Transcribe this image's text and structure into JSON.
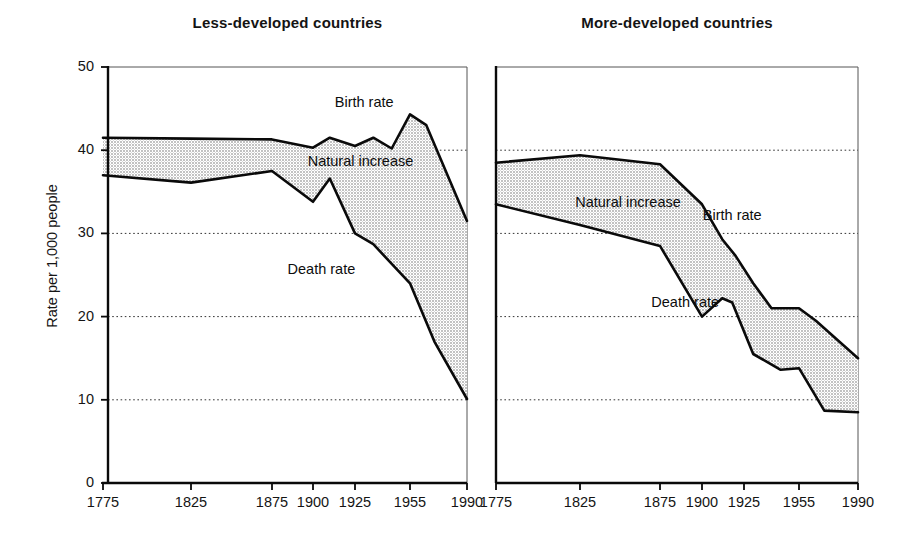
{
  "figure": {
    "ylabel": "Rate per 1,000 people",
    "series_labels": {
      "birth": "Birth rate",
      "death": "Death rate",
      "gap": "Natural increase"
    }
  },
  "chart_data": [
    {
      "type": "area",
      "title": "Less-developed countries",
      "xlabel": "",
      "ylabel": "Rate per 1,000 people",
      "ylim": [
        0,
        50
      ],
      "yticks": [
        0,
        10,
        20,
        30,
        40,
        50
      ],
      "ytick_labels": [
        "0",
        "10",
        "20",
        "30",
        "40",
        "50"
      ],
      "grid": "dotted-horizontal",
      "legend": "inline-annotations",
      "x": [
        1775,
        1825,
        1875,
        1900,
        1925,
        1955,
        1990
      ],
      "xtick_labels": [
        "1775",
        "1825",
        "1875",
        "1900",
        "1925",
        "1955",
        "1990"
      ],
      "x_spacing": "non-linear (ticks evenly mapped to label positions)",
      "series": [
        {
          "name": "Birth rate",
          "x": [
            1775,
            1825,
            1875,
            1900,
            1910,
            1925,
            1935,
            1945,
            1955,
            1965,
            1990
          ],
          "values": [
            41.5,
            41.4,
            41.3,
            40.3,
            41.5,
            40.5,
            41.5,
            40.2,
            44.3,
            43.0,
            31.5
          ]
        },
        {
          "name": "Death rate",
          "x": [
            1775,
            1825,
            1875,
            1900,
            1910,
            1925,
            1935,
            1955,
            1970,
            1990
          ],
          "values": [
            37.0,
            36.1,
            37.5,
            33.8,
            36.6,
            30.0,
            28.7,
            24.0,
            17.0,
            10.1
          ]
        }
      ],
      "annotations": [
        {
          "text": "Birth rate",
          "near_x": 1930,
          "near_y": 45.5
        },
        {
          "text": "Natural increase",
          "near_x": 1928,
          "near_y": 38.5
        },
        {
          "text": "Death rate",
          "near_x": 1905,
          "near_y": 25.5
        }
      ]
    },
    {
      "type": "area",
      "title": "More-developed countries",
      "xlabel": "",
      "ylabel": "Rate per 1,000 people",
      "ylim": [
        0,
        50
      ],
      "yticks": [
        0,
        10,
        20,
        30,
        40,
        50
      ],
      "ytick_labels": [
        "0",
        "10",
        "20",
        "30",
        "40",
        "50"
      ],
      "grid": "dotted-horizontal",
      "legend": "inline-annotations",
      "x": [
        1775,
        1825,
        1875,
        1900,
        1925,
        1955,
        1990
      ],
      "xtick_labels": [
        "1775",
        "1825",
        "1875",
        "1900",
        "1925",
        "1955",
        "1990"
      ],
      "x_spacing": "non-linear (ticks evenly mapped to label positions)",
      "series": [
        {
          "name": "Birth rate",
          "x": [
            1775,
            1825,
            1875,
            1900,
            1912,
            1920,
            1930,
            1940,
            1955,
            1965,
            1990
          ],
          "values": [
            38.5,
            39.4,
            38.3,
            33.5,
            29.3,
            27.3,
            24.0,
            21.0,
            21.0,
            19.5,
            15.0
          ]
        },
        {
          "name": "Death rate",
          "x": [
            1775,
            1825,
            1875,
            1900,
            1912,
            1918,
            1930,
            1945,
            1955,
            1970,
            1990
          ],
          "values": [
            33.5,
            31.0,
            28.5,
            20.0,
            22.2,
            21.7,
            15.5,
            13.6,
            13.8,
            8.7,
            8.5
          ]
        }
      ],
      "annotations": [
        {
          "text": "Birth rate",
          "near_x": 1918,
          "near_y": 32.0
        },
        {
          "text": "Natural increase",
          "near_x": 1855,
          "near_y": 33.5
        },
        {
          "text": "Death rate",
          "near_x": 1890,
          "near_y": 21.5
        }
      ]
    }
  ]
}
